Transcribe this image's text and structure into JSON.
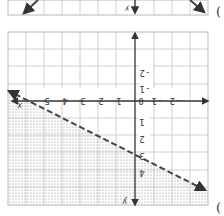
{
  "orientation": "rotated 180 degrees",
  "top_graph": {
    "axis_label_y": "y",
    "answer_marker": "("
  },
  "main_graph": {
    "x_tick_labels": [
      "5",
      "4",
      "3",
      "2",
      "1",
      "0",
      "-1",
      "-2"
    ],
    "y_tick_labels_above": [
      "-1",
      "-2"
    ],
    "y_tick_labels_below": [
      "1",
      "2",
      "3",
      "4"
    ],
    "axis_label_x": "x",
    "axis_label_y": "y",
    "boundary_line": "dashed",
    "shading": "dotted region below boundary line",
    "y_intercept_label": "3",
    "answer_marker": "("
  },
  "colors": {
    "grid": "#b8b8b8",
    "axis": "#333333",
    "line": "#444444",
    "shade_dot": "#888888",
    "text": "#333333"
  }
}
